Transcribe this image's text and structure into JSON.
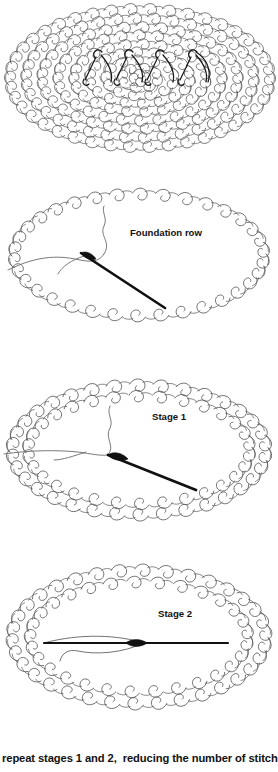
{
  "document": {
    "title": "Nalbinding oval shaping diagram",
    "background_color": "#ffffff",
    "line_color": "#555555",
    "accent_line_color": "#000000",
    "text_color": "#111111"
  },
  "caption": {
    "text": "repeat stages 1 and 2,  reducing the number of stitches"
  },
  "panels": [
    {
      "id": "panel-1",
      "label": "",
      "description": "filled oval of nalbinding stitches with dark working row",
      "fabric": "filled-oval",
      "has_needle": false
    },
    {
      "id": "panel-2",
      "label": "Foundation row",
      "description": "single ring of chain stitches with threaded needle inside",
      "fabric": "single-ring",
      "has_needle": true
    },
    {
      "id": "panel-3",
      "label": "Stage 1",
      "description": "double ring of stitches with needle pointing left",
      "fabric": "double-ring",
      "has_needle": true
    },
    {
      "id": "panel-4",
      "label": "Stage 2",
      "description": "double ring of stitches with horizontal needle",
      "fabric": "double-ring",
      "has_needle": true
    }
  ],
  "chart_data": {
    "type": "diagram",
    "series": [
      {
        "name": "Panel 1",
        "label": "",
        "stage": 0
      },
      {
        "name": "Panel 2",
        "label": "Foundation row",
        "stage": 1
      },
      {
        "name": "Panel 3",
        "label": "Stage 1",
        "stage": 2
      },
      {
        "name": "Panel 4",
        "label": "Stage 2",
        "stage": 3
      }
    ],
    "annotations": [
      "Foundation row",
      "Stage 1",
      "Stage 2",
      "repeat stages 1 and 2,  reducing the number of stitches"
    ]
  }
}
